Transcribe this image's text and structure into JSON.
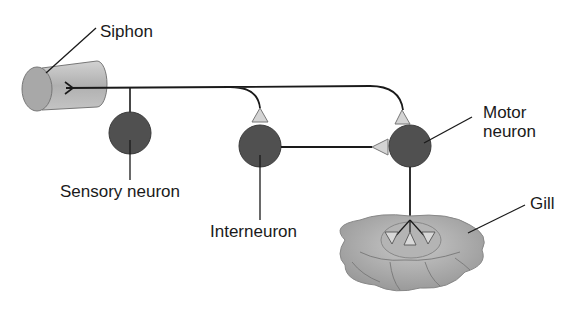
{
  "diagram": {
    "type": "neural-circuit",
    "labels": {
      "siphon": "Siphon",
      "sensory_neuron": "Sensory neuron",
      "interneuron": "Interneuron",
      "motor_neuron_line1": "Motor",
      "motor_neuron_line2": "neuron",
      "gill": "Gill"
    },
    "colors": {
      "neuron_fill": "#505050",
      "synapse_fill": "#d4d4d4",
      "siphon_fill": "#b8b8b8",
      "gill_fill": "#a8a8a8",
      "line": "#1a1a1a"
    }
  }
}
